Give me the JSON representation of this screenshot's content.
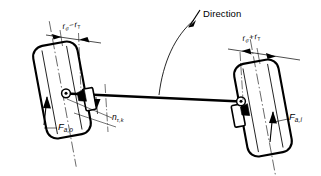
{
  "figure": {
    "background_color": "#ffffff",
    "line_color": "#000000",
    "width": 321,
    "height": 176
  },
  "annotations": {
    "direction": {
      "label": "Direction",
      "icon": "arrow-up-left-icon",
      "arc": "curved-direction-arc"
    },
    "dimension_left": {
      "symbol": "r",
      "subscript_1": "σ",
      "operator": "−",
      "symbol_2": "r",
      "subscript_2": "T",
      "full_text": "rσ − rT"
    },
    "dimension_right": {
      "symbol": "r",
      "subscript_1": "σ",
      "operator": "+",
      "symbol_2": "r",
      "subscript_2": "T",
      "full_text": "rσ + rT"
    },
    "offset": {
      "symbol": "n",
      "subscript": "τ,k",
      "full_text": "nτ,k"
    },
    "force_outer": {
      "symbol": "F",
      "subscript": "a,o",
      "full_text": "Fa,o"
    },
    "force_inner": {
      "symbol": "F",
      "subscript": "a,i",
      "full_text": "Fa,i"
    }
  },
  "components": {
    "wheel_left": "wheel-outer",
    "wheel_right": "wheel-inner",
    "tie_rod": "tie-rod",
    "joint_left": "steering-joint-left",
    "joint_right": "steering-joint-right",
    "knuckle_left": "steering-knuckle-left",
    "knuckle_right": "steering-knuckle-right",
    "force_arrow_left": "force-arrow-outer",
    "force_arrow_right": "force-arrow-inner"
  }
}
